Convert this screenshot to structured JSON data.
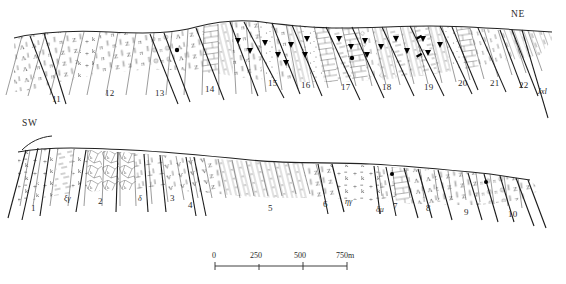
{
  "figure": {
    "type": "geological-cross-section",
    "orientation_labels": {
      "left": "SW",
      "right": "NE"
    },
    "formation_code": "Jxl"
  },
  "upper_profile": {
    "direction_label": "NE",
    "unit_numbers": [
      "11",
      "12",
      "13",
      "14",
      "15",
      "16",
      "17",
      "18",
      "19",
      "20",
      "21",
      "22"
    ],
    "unit_label_positions": [
      {
        "label": "11",
        "x": 58,
        "y": 93
      },
      {
        "label": "12",
        "x": 110,
        "y": 88
      },
      {
        "label": "13",
        "x": 160,
        "y": 88
      },
      {
        "label": "14",
        "x": 210,
        "y": 84
      },
      {
        "label": "15",
        "x": 272,
        "y": 80
      },
      {
        "label": "16",
        "x": 305,
        "y": 82
      },
      {
        "label": "17",
        "x": 345,
        "y": 84
      },
      {
        "label": "18",
        "x": 386,
        "y": 84
      },
      {
        "label": "19",
        "x": 428,
        "y": 84
      },
      {
        "label": "20",
        "x": 462,
        "y": 80
      },
      {
        "label": "21",
        "x": 494,
        "y": 80
      },
      {
        "label": "22",
        "x": 523,
        "y": 82
      }
    ],
    "formation_code": "Jxl",
    "formation_code_position": {
      "x": 540,
      "y": 90
    }
  },
  "lower_profile": {
    "direction_label": "SW",
    "unit_numbers": [
      "1",
      "2",
      "3",
      "4",
      "5",
      "6",
      "7",
      "8",
      "9",
      "10"
    ],
    "unit_label_positions": [
      {
        "label": "1",
        "x": 33,
        "y": 207
      },
      {
        "label": "2",
        "x": 100,
        "y": 200
      },
      {
        "label": "3",
        "x": 172,
        "y": 197
      },
      {
        "label": "4",
        "x": 190,
        "y": 204
      },
      {
        "label": "5",
        "x": 270,
        "y": 207
      },
      {
        "label": "6",
        "x": 325,
        "y": 203
      },
      {
        "label": "7",
        "x": 395,
        "y": 205
      },
      {
        "label": "8",
        "x": 428,
        "y": 207
      },
      {
        "label": "9",
        "x": 466,
        "y": 211
      },
      {
        "label": "10",
        "x": 512,
        "y": 213
      }
    ],
    "intrusion_codes": [
      {
        "label": "ξγ",
        "x": 68,
        "y": 198
      },
      {
        "label": "δ",
        "x": 140,
        "y": 198
      },
      {
        "label": "ηγ",
        "x": 349,
        "y": 201
      },
      {
        "label": "δμ",
        "x": 380,
        "y": 209
      }
    ]
  },
  "scale_bar": {
    "ticks": [
      "0",
      "250",
      "500",
      "750m"
    ],
    "unit": "m",
    "tick_positions_px": [
      215,
      259,
      303,
      347
    ]
  },
  "colors": {
    "ink": "#2a2a2a",
    "line": "#333333",
    "fill": "#ffffff",
    "symbol": "#000000"
  }
}
